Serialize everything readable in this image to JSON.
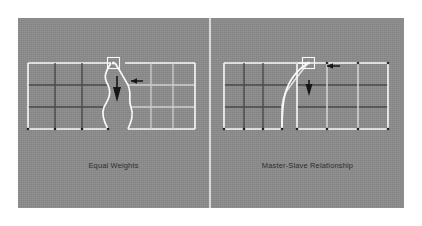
{
  "figure": {
    "title_visible": false,
    "background_color": "#ffffff",
    "panel_color": "#8c8c8c",
    "divider_color": "#d8d8d8",
    "mesh_light_color": "#ffffff",
    "mesh_dark_color": "#3c3c3c",
    "arrow_color": "#1a1a1a",
    "selection_box_color": "#ffffff",
    "caption_color": "#2e2e2e"
  },
  "panels": [
    {
      "id": "equal-weights",
      "caption": "Equal Weights",
      "left_mesh": {
        "columns": 3,
        "rows": 3,
        "deformed_edge": "right",
        "deformation": "symmetric pull toward selected vertex"
      },
      "right_mesh": {
        "columns": 3,
        "rows": 3,
        "deformed_edge": "left",
        "deformation": "symmetric pull toward selected vertex"
      },
      "selection": {
        "type": "vertex-selection-box",
        "position": "top-center, shared corner vertex"
      },
      "annotations": [
        {
          "name": "left-arrow",
          "glyph": "arrow-left",
          "direction": "left"
        },
        {
          "name": "down-arrow",
          "glyph": "arrow-down",
          "direction": "down"
        }
      ]
    },
    {
      "id": "master-slave-relationship",
      "caption": "Master-Slave Relationship",
      "left_mesh": {
        "columns": 3,
        "rows": 3,
        "deformed_edge": "right",
        "deformation": "single-sided curve following master vertex"
      },
      "right_mesh": {
        "columns": 3,
        "rows": 3,
        "deformed_edge": "left",
        "deformation": "rigid, unaffected"
      },
      "selection": {
        "type": "vertex-selection-box",
        "position": "top-center, master vertex"
      },
      "annotations": [
        {
          "name": "left-arrow",
          "glyph": "arrow-left",
          "direction": "left"
        },
        {
          "name": "down-arrow",
          "glyph": "arrow-down",
          "direction": "down"
        }
      ]
    }
  ]
}
